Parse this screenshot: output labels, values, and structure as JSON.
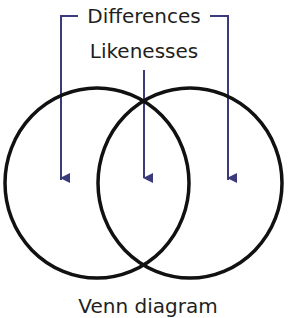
{
  "diagram": {
    "labels": {
      "differences": "Differences",
      "likenesses": "Likenesses",
      "caption": "Venn diagram"
    },
    "colors": {
      "circle_stroke": "#111111",
      "arrow": "#3b3a7a",
      "text": "#231f20"
    },
    "circles": [
      {
        "name": "left-set"
      },
      {
        "name": "right-set"
      }
    ],
    "arrows": [
      {
        "target": "left-only region",
        "group": "Differences"
      },
      {
        "target": "overlap region",
        "group": "Likenesses"
      },
      {
        "target": "right-only region",
        "group": "Differences"
      }
    ]
  }
}
